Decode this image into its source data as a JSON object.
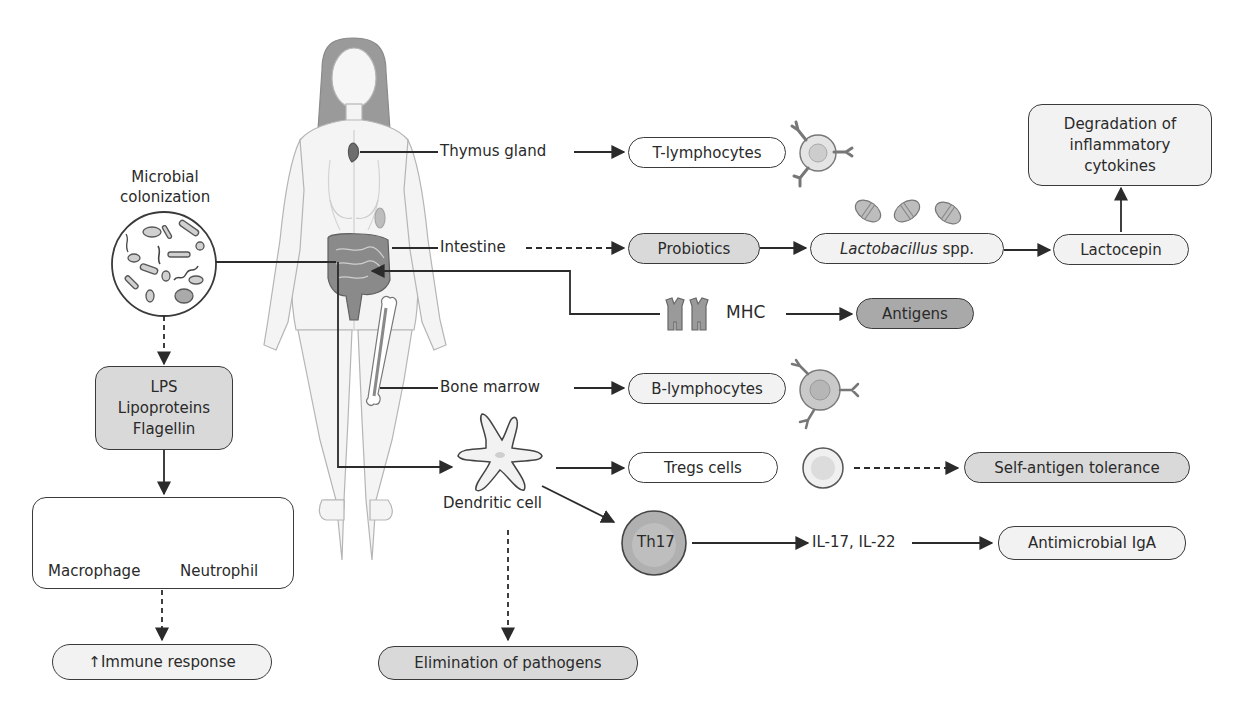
{
  "colors": {
    "line": "#2b2b2b",
    "box_light": "#f2f2f2",
    "box_mid": "#d9d9d9",
    "box_dark": "#a9a9a9",
    "organ": "#7d7d7d",
    "body_outline": "#bdbdbd"
  },
  "left_column": {
    "microbial_title_line1": "Microbial",
    "microbial_title_line2": "colonization",
    "microbes_icon": "microbe-circle-icon",
    "lps_box": {
      "line1": "LPS",
      "line2": "Lipoproteins",
      "line3": "Flagellin"
    },
    "innate_cells": {
      "macrophage": "Macrophage",
      "neutrophil": "Neutrophil"
    },
    "immune_response": "↑Immune response"
  },
  "body": {
    "figure_icon": "human-body-icon",
    "organs": {
      "thymus": "Thymus gland",
      "intestine": "Intestine",
      "bone_marrow": "Bone marrow"
    }
  },
  "right_flow": {
    "t_lymphocytes": "T-lymphocytes",
    "probiotics": "Probiotics",
    "lactobacillus_italic": "Lactobacillus",
    "lactobacillus_rest": " spp.",
    "lactocepin": "Lactocepin",
    "degradation_line1": "Degradation of",
    "degradation_line2": "inflammatory",
    "degradation_line3": "cytokines",
    "mhc": "MHC",
    "antigens": "Antigens",
    "b_lymphocytes": "B-lymphocytes",
    "dendritic_cell": "Dendritic cell",
    "tregs": "Tregs cells",
    "self_antigen": "Self-antigen tolerance",
    "th17": "Th17",
    "il": "IL-17, IL-22",
    "iga": "Antimicrobial IgA",
    "elimination": "Elimination of pathogens"
  }
}
